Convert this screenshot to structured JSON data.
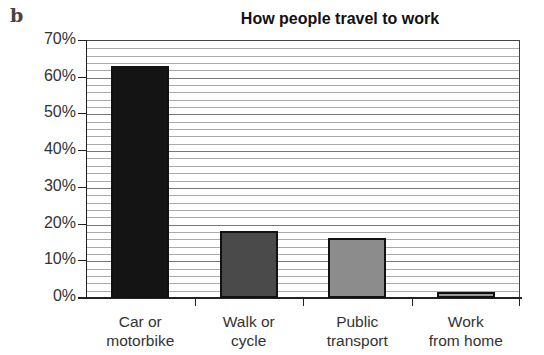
{
  "panel_label": "b",
  "chart_data": {
    "type": "bar",
    "title": "How people travel to work",
    "categories": [
      "Car or motorbike",
      "Walk or cycle",
      "Public transport",
      "Work from home"
    ],
    "category_lines": [
      [
        "Car or",
        "motorbike"
      ],
      [
        "Walk or",
        "cycle"
      ],
      [
        "Public",
        "transport"
      ],
      [
        "Work",
        "from home"
      ]
    ],
    "values": [
      63,
      18,
      16,
      1
    ],
    "unit": "%",
    "xlabel": "",
    "ylabel": "",
    "ylim": [
      0,
      70
    ],
    "yticks": [
      "0%",
      "10%",
      "20%",
      "30%",
      "40%",
      "50%",
      "60%",
      "70%"
    ],
    "grid": true,
    "minor_grid_step": 2,
    "legend": null,
    "bar_colors": [
      "#141414",
      "#4a4a4a",
      "#8c8c8c",
      "#9a9a9a"
    ]
  }
}
